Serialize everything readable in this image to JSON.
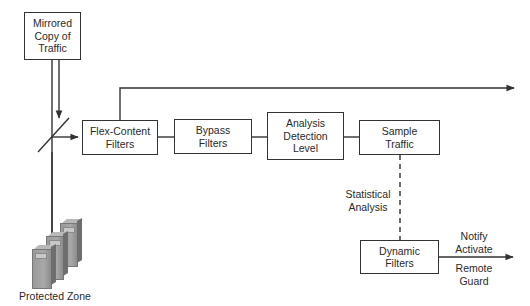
{
  "diagram": {
    "nodes": {
      "mirrored_copy": {
        "label": "Mirrored\nCopy of\nTraffic"
      },
      "flex_content": {
        "label": "Flex-Content\nFilters"
      },
      "bypass": {
        "label": "Bypass\nFilters"
      },
      "analysis": {
        "label": "Analysis\nDetection\nLevel"
      },
      "sample_traffic": {
        "label": "Sample\nTraffic"
      },
      "dynamic_filters": {
        "label": "Dynamic\nFilters"
      },
      "protected_zone": {
        "label": "Protected Zone"
      }
    },
    "edge_labels": {
      "statistical_analysis": "Statistical\nAnalysis",
      "notify_activate": "Notify\nActivate",
      "remote_guard": "Remote\nGuard"
    },
    "colors": {
      "line": "#333333",
      "server": "#9a9a9a"
    }
  }
}
